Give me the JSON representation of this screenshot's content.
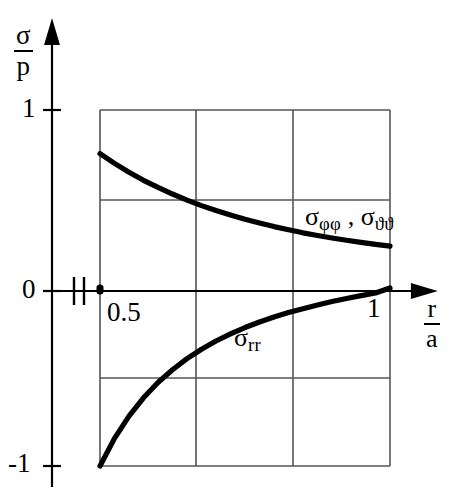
{
  "figure": {
    "title": "",
    "y_axis_label": {
      "numerator": "σ",
      "denominator": "p"
    },
    "x_axis_label": {
      "numerator": "r",
      "denominator": "a"
    },
    "y_ticks": [
      "1",
      "0",
      "-1"
    ],
    "x_ticks": [
      "0.5",
      "1"
    ],
    "curve_labels": {
      "hoop": {
        "base1": "σ",
        "sub1": "φφ",
        "separator": " , ",
        "base2": "σ",
        "sub2": "ϑϑ"
      },
      "radial": {
        "base": "σ",
        "sub": "rr"
      }
    },
    "axis_break_marker": "axis-break",
    "origin_dot_marker": "data-point-dot",
    "line_color": "#000000",
    "grid_color": "#555555",
    "background_color": "#ffffff"
  },
  "chart_data": {
    "type": "line",
    "title": "",
    "xlabel": "r/a",
    "ylabel": "σ/p",
    "xlim": [
      0.5,
      1.0
    ],
    "ylim": [
      -1,
      1
    ],
    "grid": true,
    "legend": "inline-annotations",
    "x_tick_values": [
      0.5,
      1.0
    ],
    "y_tick_values": [
      1,
      0,
      -1
    ],
    "x_gridlines": [
      0.5,
      0.625,
      0.75,
      0.875,
      1.0
    ],
    "y_gridlines": [
      1,
      0.5,
      0,
      -0.5,
      -1
    ],
    "series": [
      {
        "name": "σφφ , σϑϑ",
        "x": [
          0.5,
          0.525,
          0.55,
          0.575,
          0.6,
          0.625,
          0.65,
          0.675,
          0.7,
          0.725,
          0.75,
          0.775,
          0.8,
          0.825,
          0.85,
          0.875,
          0.9,
          0.925,
          0.95,
          0.975,
          1.0
        ],
        "values": [
          0.755,
          0.7,
          0.65,
          0.605,
          0.565,
          0.528,
          0.494,
          0.463,
          0.435,
          0.41,
          0.386,
          0.365,
          0.345,
          0.327,
          0.31,
          0.295,
          0.281,
          0.268,
          0.256,
          0.245,
          0.235
        ]
      },
      {
        "name": "σrr",
        "x": [
          0.5,
          0.525,
          0.55,
          0.575,
          0.6,
          0.625,
          0.65,
          0.675,
          0.7,
          0.725,
          0.75,
          0.775,
          0.8,
          0.825,
          0.85,
          0.875,
          0.9,
          0.925,
          0.95,
          0.975,
          1.0
        ],
        "values": [
          -1.0,
          -0.845,
          -0.72,
          -0.617,
          -0.531,
          -0.459,
          -0.397,
          -0.344,
          -0.298,
          -0.258,
          -0.222,
          -0.191,
          -0.163,
          -0.138,
          -0.116,
          -0.095,
          -0.076,
          -0.059,
          -0.043,
          -0.028,
          0.0
        ]
      }
    ]
  }
}
